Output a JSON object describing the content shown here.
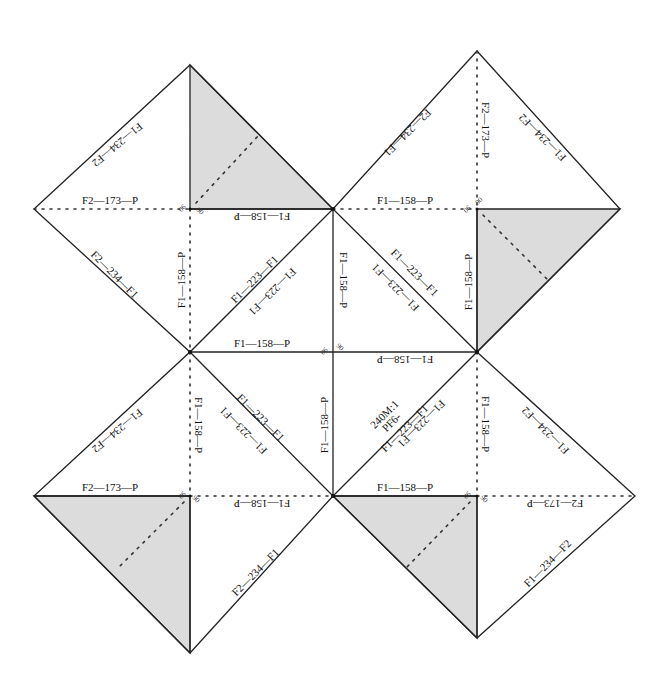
{
  "diagram": {
    "title": "",
    "scale_note": "240M:1",
    "ion_label": "PF6-",
    "vertices": {
      "A_top_left_apex": [
        190,
        65
      ],
      "B_top_right_apex": [
        477,
        51
      ],
      "L1": [
        34,
        209
      ],
      "C1": [
        190,
        209
      ],
      "M1": [
        333,
        209
      ],
      "C2": [
        477,
        209
      ],
      "R1": [
        620,
        209
      ],
      "L2": [
        190,
        352
      ],
      "M2": [
        333,
        352
      ],
      "R2": [
        477,
        352
      ],
      "L3": [
        34,
        496
      ],
      "C3": [
        190,
        496
      ],
      "M3": [
        333,
        496
      ],
      "C4": [
        477,
        496
      ],
      "R3": [
        635,
        496
      ],
      "D_bottom_left": [
        190,
        653
      ],
      "E_bottom_right": [
        477,
        638
      ]
    },
    "labels": {
      "tl_upper_left_edge": "F1—234—F2",
      "tl_horizontal": "F2—173—P",
      "tl_lower_left_edge": "F2—234—F1",
      "tl_bottom_rot": "F1—158—P",
      "tl_vertical_dotted": "F1—158—P",
      "tr_left_edge": "F2—234—F1",
      "tr_vertical_dotted": "F2—173—P",
      "tr_right_edge": "F1—234—F2",
      "tr_horizontal": "F1—158—P",
      "tr_vertical_solid": "F1—158—P",
      "center_top_rot": "F1—158—P",
      "center_left_diag_a": "F1—223—F1",
      "center_left_diag_b": "F1—223—F1",
      "center_right_diag_a": "F1—223—F1",
      "center_right_diag_b": "F1—223—F1",
      "center_vertical": "F1—158—P",
      "center_horizontal": "F1—158—P",
      "center_horizontal_rot": "F1—158—P",
      "lower_vertical": "F1—158—P",
      "lower_left_diag_a": "F1—223—F1",
      "lower_left_diag_b": "F1—223—F1",
      "lower_right_diag_a": "F1—223—F1",
      "lower_right_diag_b": "F1—223—F1",
      "bl_upper_left_edge": "F1—234—F2",
      "bl_vertical_dotted": "F1—158—P",
      "bl_horizontal": "F2—173—P",
      "bl_horizontal_rot": "F1—158—P",
      "bl_lower_right_edge": "F2—234—F1",
      "br_vertical_dotted": "F1—158—P",
      "br_upper_right_edge": "F1—234—F2",
      "br_horizontal": "F1—158—P",
      "br_horizontal_rot": "F2—173—P",
      "br_lower_right_edge": "F1—234—F2",
      "right_vertical_lower": "F1—158—P"
    },
    "angle_label": "90"
  }
}
